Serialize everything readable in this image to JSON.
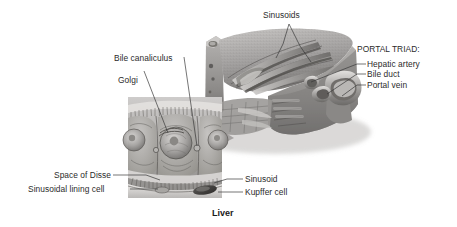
{
  "figure": {
    "caption": "Liver",
    "background_color": "#ffffff",
    "text_color": "#2b2b2b",
    "art_style": "grayscale anatomical illustration"
  },
  "labels": {
    "sinusoids_top": "Sinusoids",
    "portal_triad_heading": "PORTAL TRIAD:",
    "hepatic_artery": "Hepatic artery",
    "bile_duct": "Bile duct",
    "portal_vein": "Portal vein",
    "bile_canaliculus": "Bile canaliculus",
    "golgi": "Golgi",
    "space_of_disse": "Space of Disse",
    "sinusoidal_lining_cell": "Sinusoidal lining cell",
    "sinusoid": "Sinusoid",
    "kupffer_cell": "Kupffer cell"
  },
  "structures": {
    "main_block": "liver-lobule-block",
    "inset": "hepatocyte-detail-inset",
    "portal_vessels": "portal-triad-vessels",
    "kupffer": "kupffer-cell-shape",
    "microvilli": "microvilli-fringe"
  },
  "colors": {
    "ink": "#2b2b2b",
    "leader": "#3a3a3a",
    "tissue_light": "#d6d4d2",
    "tissue_mid": "#a9a7a5",
    "tissue_dark": "#6f6d6b",
    "tissue_deep": "#4a4846"
  }
}
